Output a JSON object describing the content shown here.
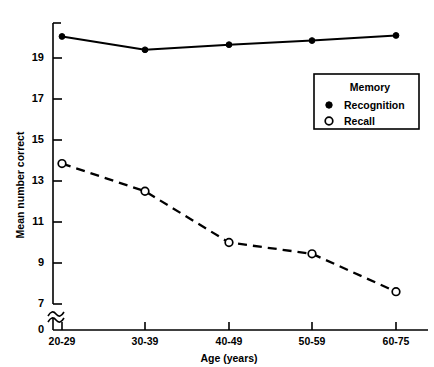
{
  "chart_data": {
    "type": "line",
    "title": "",
    "xlabel": "Age (years)",
    "ylabel": "Mean number correct",
    "categories": [
      "20-29",
      "30-39",
      "40-49",
      "50-59",
      "60-75"
    ],
    "yticks": [
      "0",
      "7",
      "9",
      "11",
      "13",
      "15",
      "17",
      "19"
    ],
    "ylim": [
      7,
      20.9
    ],
    "grid": false,
    "axis_break": true,
    "legend": {
      "position": "inside-upper-right",
      "title": "Memory",
      "entries": [
        {
          "name": "Recognition",
          "marker": "filled-circle",
          "line": "solid"
        },
        {
          "name": "Recall",
          "marker": "open-circle",
          "line": "dashed"
        }
      ]
    },
    "series": [
      {
        "name": "Recognition",
        "values": [
          20.05,
          19.4,
          19.65,
          19.85,
          20.1
        ]
      },
      {
        "name": "Recall",
        "values": [
          13.85,
          12.5,
          10.0,
          9.45,
          7.6
        ]
      }
    ]
  },
  "colors": {
    "ink": "#000000",
    "background": "#ffffff"
  }
}
